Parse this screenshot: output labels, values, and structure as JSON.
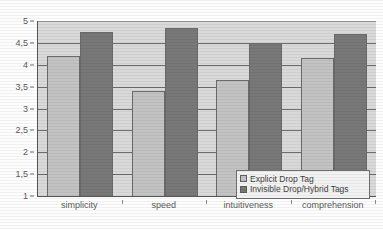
{
  "chart_data": {
    "type": "bar",
    "title": "",
    "subtitle": "",
    "xlabel": "",
    "ylabel": "",
    "categories": [
      "simplicity",
      "speed",
      "intuitiveness",
      "comprehension"
    ],
    "series": [
      {
        "name": "Explicit Drop Tag",
        "color": "#c3c3c3",
        "values": [
          4.2,
          3.4,
          3.65,
          4.15
        ]
      },
      {
        "name": "Invisible Drop/Hybrid Tags",
        "color": "#787878",
        "values": [
          4.75,
          4.85,
          4.5,
          4.7
        ]
      }
    ],
    "ylim": [
      1,
      5
    ],
    "ytick_step": 0.5,
    "ytick_labels": [
      "5",
      "4,5",
      "4",
      "3,5",
      "3",
      "2,5",
      "2",
      "1,5",
      "1"
    ],
    "ytick_values": [
      5,
      4.5,
      4,
      3.5,
      3,
      2.5,
      2,
      1.5,
      1
    ],
    "grid": true,
    "grid_axis": "y",
    "legend_position": "bottom-right",
    "decimal_separator": ",",
    "plot_background": "#d9d9d9",
    "axis_color": "#555555"
  }
}
